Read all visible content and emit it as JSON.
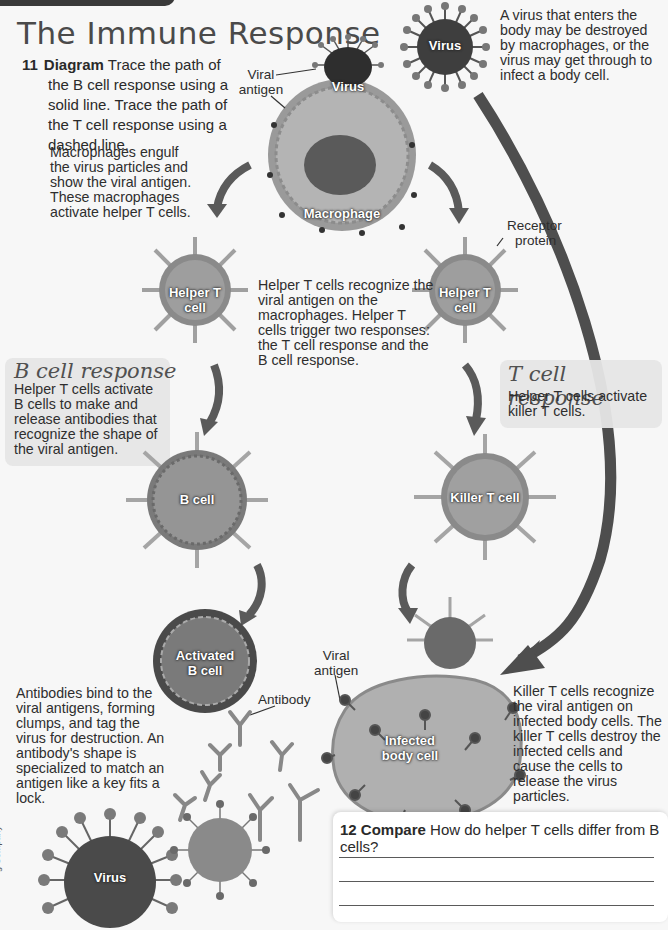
{
  "page": {
    "title": "The Immune Response",
    "credit_margin_text": "g Company"
  },
  "question_11": {
    "number": "11",
    "keyword": "Diagram",
    "text": "Trace the path of the B cell response using a solid line. Trace the path of the T cell response using a dashed line."
  },
  "captions": {
    "virus_intro": "A virus that enters the body may be destroyed by macrophages, or the virus may get through to infect a body cell.",
    "macrophage": "Macrophages engulf the virus particles and show the viral antigen. These macrophages activate helper T cells.",
    "helper_t": "Helper T cells recognize the viral antigen on the macrophages. Helper T cells trigger two responses: the T cell response and the B cell response.",
    "antibodies": "Antibodies bind to the viral antigens, forming clumps, and tag the virus for destruction. An antibody's shape is specialized to match an antigen like a key fits a lock.",
    "killer_t": "Killer T cells recognize the viral antigen on infected body cells. The killer T cells destroy the infected cells and cause the cells to release the virus particles."
  },
  "b_cell_response": {
    "heading": "B cell response",
    "text": "Helper T cells activate B cells to make and release antibodies that recognize the shape of the viral antigen."
  },
  "t_cell_response": {
    "heading": "T cell response",
    "text": "Helper T cells activate killer T cells."
  },
  "callouts": {
    "viral_antigen_top": [
      "Viral",
      "antigen"
    ],
    "receptor_protein": [
      "Receptor",
      "protein"
    ],
    "antibody": "Antibody",
    "viral_antigen_bottom": [
      "Viral",
      "antigen"
    ]
  },
  "cell_labels": {
    "virus_top_right": "Virus",
    "virus_on_macrophage": "Virus",
    "macrophage": "Macrophage",
    "helper_t_left": [
      "Helper T",
      "cell"
    ],
    "helper_t_right": [
      "Helper T",
      "cell"
    ],
    "b_cell": "B cell",
    "killer_t": "Killer T cell",
    "activated_b": [
      "Activated",
      "B cell"
    ],
    "infected_body_cell": [
      "Infected",
      "body cell"
    ],
    "virus_bottom": "Virus"
  },
  "question_12": {
    "number": "12",
    "keyword": "Compare",
    "text": "How do helper T cells differ from B cells?",
    "answer_lines": 3
  },
  "colors": {
    "background": "#f7f7f7",
    "text": "#2a2a2a",
    "title": "#4a4a4a",
    "response_box": "#e6e6e6",
    "arrow": "#555555",
    "cell_gray": "#8a8a8a"
  }
}
